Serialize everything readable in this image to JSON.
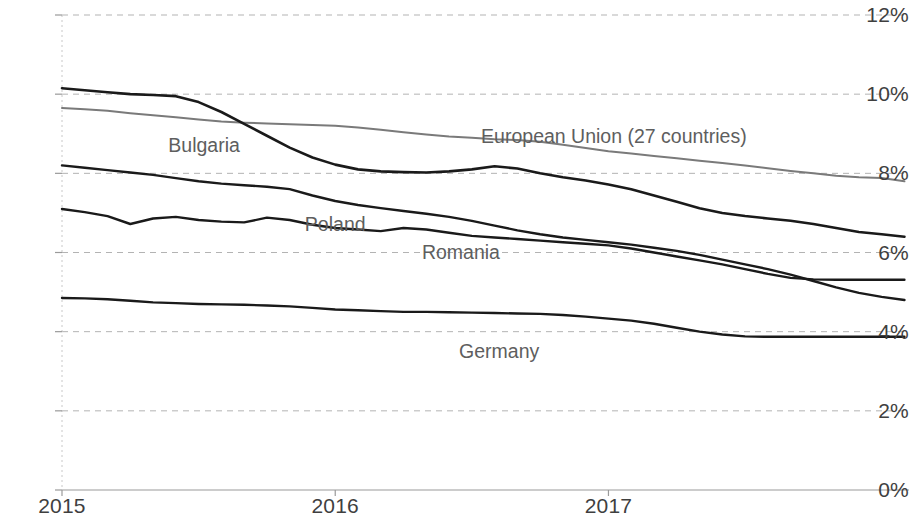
{
  "chart_data": {
    "type": "line",
    "title": "",
    "subtitle": "",
    "xlabel": "",
    "ylabel": "",
    "grid": true,
    "legend_position": "inline-labels",
    "ylim": [
      0,
      12
    ],
    "ytick_labels": [
      "12%",
      "10%",
      "8%",
      "6%",
      "4%",
      "2%",
      "0%"
    ],
    "ytick_values": [
      12,
      10,
      8,
      6,
      4,
      2,
      0
    ],
    "xtick_labels": [
      "2015",
      "2016",
      "2017"
    ],
    "xtick_values": [
      2015,
      2016,
      2017
    ],
    "xlim": [
      2015,
      2018.1
    ],
    "x": [
      2015.0,
      2015.0833,
      2015.1667,
      2015.25,
      2015.3333,
      2015.4167,
      2015.5,
      2015.5833,
      2015.6667,
      2015.75,
      2015.8333,
      2015.9167,
      2016.0,
      2016.0833,
      2016.1667,
      2016.25,
      2016.3333,
      2016.4167,
      2016.5,
      2016.5833,
      2016.6667,
      2016.75,
      2016.8333,
      2016.9167,
      2017.0,
      2017.0833,
      2017.1667,
      2017.25,
      2017.3333,
      2017.4167,
      2017.5,
      2017.5833,
      2017.6667,
      2017.75,
      2017.8333,
      2017.9167,
      2018.0,
      2018.0833
    ],
    "series": [
      {
        "name": "European Union (27 countries)",
        "color": "#7a7a7a",
        "width": 2.0,
        "label_x": 2017.02,
        "label_y": 8.95,
        "values": [
          9.65,
          9.62,
          9.58,
          9.52,
          9.47,
          9.42,
          9.36,
          9.31,
          9.28,
          9.26,
          9.24,
          9.22,
          9.2,
          9.16,
          9.1,
          9.04,
          8.98,
          8.93,
          8.9,
          8.86,
          8.84,
          8.8,
          8.72,
          8.64,
          8.56,
          8.5,
          8.44,
          8.38,
          8.32,
          8.26,
          8.2,
          8.13,
          8.06,
          8.0,
          7.94,
          7.9,
          7.88,
          7.8
        ]
      },
      {
        "name": "Bulgaria",
        "color": "#1a1a1a",
        "width": 2.6,
        "label_x": 2015.52,
        "label_y": 8.72,
        "values": [
          10.15,
          10.1,
          10.05,
          10.0,
          9.98,
          9.95,
          9.8,
          9.55,
          9.25,
          8.95,
          8.65,
          8.4,
          8.22,
          8.1,
          8.05,
          8.03,
          8.02,
          8.05,
          8.1,
          8.18,
          8.12,
          8.0,
          7.9,
          7.82,
          7.72,
          7.6,
          7.44,
          7.28,
          7.12,
          7.0,
          6.92,
          6.86,
          6.8,
          6.72,
          6.62,
          6.52,
          6.46,
          6.4
        ]
      },
      {
        "name": "Poland",
        "color": "#1a1a1a",
        "width": 2.4,
        "label_x": 2016.0,
        "label_y": 6.72,
        "values": [
          8.2,
          8.14,
          8.08,
          8.02,
          7.96,
          7.88,
          7.8,
          7.74,
          7.7,
          7.66,
          7.6,
          7.44,
          7.3,
          7.2,
          7.12,
          7.05,
          6.98,
          6.9,
          6.8,
          6.68,
          6.56,
          6.46,
          6.38,
          6.32,
          6.26,
          6.2,
          6.12,
          6.04,
          5.94,
          5.82,
          5.7,
          5.58,
          5.44,
          5.28,
          5.12,
          4.98,
          4.88,
          4.8
        ]
      },
      {
        "name": "Romania",
        "color": "#1a1a1a",
        "width": 2.4,
        "label_x": 2016.46,
        "label_y": 6.02,
        "values": [
          7.1,
          7.02,
          6.92,
          6.72,
          6.86,
          6.9,
          6.82,
          6.78,
          6.76,
          6.88,
          6.82,
          6.7,
          6.62,
          6.58,
          6.54,
          6.62,
          6.58,
          6.5,
          6.42,
          6.38,
          6.34,
          6.3,
          6.26,
          6.22,
          6.18,
          6.1,
          6.0,
          5.9,
          5.8,
          5.7,
          5.58,
          5.46,
          5.36,
          5.32,
          5.31,
          5.31,
          5.31,
          5.31
        ]
      },
      {
        "name": "Germany",
        "color": "#1a1a1a",
        "width": 2.4,
        "label_x": 2016.6,
        "label_y": 3.5,
        "values": [
          4.85,
          4.84,
          4.82,
          4.78,
          4.74,
          4.72,
          4.7,
          4.69,
          4.68,
          4.66,
          4.64,
          4.6,
          4.56,
          4.54,
          4.52,
          4.5,
          4.5,
          4.49,
          4.48,
          4.47,
          4.46,
          4.45,
          4.42,
          4.38,
          4.33,
          4.28,
          4.2,
          4.1,
          4.0,
          3.93,
          3.88,
          3.87,
          3.87,
          3.87,
          3.87,
          3.87,
          3.87,
          3.87
        ]
      }
    ]
  },
  "axis": {
    "gridline_color": "#b3b3b3",
    "axis_color": "#9a9a9a",
    "tick_text_color": "#3f3f3f",
    "label_text_color": "#5e5e5e"
  }
}
